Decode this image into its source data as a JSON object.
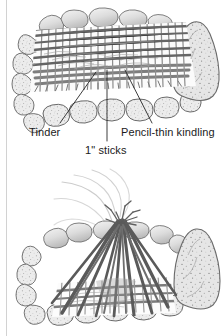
{
  "page": {
    "background_color": "#ffffff",
    "margin_rule_color": "#d2d2d2",
    "ink_color": "#1a1a1a"
  },
  "figures": [
    {
      "id": "figure-top",
      "name": "log-cabin-fire-lay",
      "caption": "Top view of an unlit log cabin fire lay built inside a ring of stones",
      "elements": [
        "stone-ring",
        "large-right-boulder",
        "woven-stick-lattice",
        "tinder-bundle",
        "pencil-thin-kindling-layer",
        "one-inch-stick-layer"
      ]
    },
    {
      "id": "figure-bottom",
      "name": "teepee-fire-lay",
      "caption": "Teepee of poles leaning over the lattice base with smoke rising",
      "elements": [
        "stone-ring",
        "large-right-boulder",
        "teepee-poles",
        "lattice-base",
        "rising-smoke"
      ]
    }
  ],
  "callouts": [
    {
      "id": "tinder",
      "label": "Tinder",
      "leader_from": [
        60,
        123
      ],
      "leader_to": [
        96,
        72
      ]
    },
    {
      "id": "sticks",
      "label": "1\" sticks",
      "leader_from": [
        107,
        141
      ],
      "leader_to": [
        107,
        70
      ]
    },
    {
      "id": "kindling",
      "label": "Pencil-thin kindling",
      "leader_from": [
        152,
        123
      ],
      "leader_to": [
        125,
        70
      ]
    }
  ],
  "palette": {
    "ink": "#1a1a1a",
    "stone_outline": "#6f6f6f",
    "stone_fill": "#e8e8e8",
    "stone_shadow": "#bdbdbd",
    "wood_dark": "#585858",
    "wood_mid": "#8c8c8c",
    "wood_light": "#b5b5b5",
    "smoke": "#cfcfcf",
    "paper": "#ffffff"
  }
}
